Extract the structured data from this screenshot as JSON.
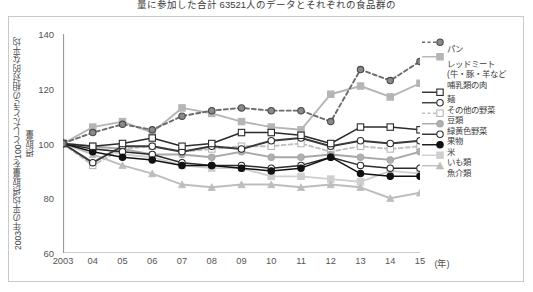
{
  "caption_top": "量に参加した合計 63521人のデータとそれぞれの食品群の",
  "axis": {
    "ylabel": "2003年の平均摂取量を100としたときの相対的な平均摂取量",
    "yticks": [
      140,
      120,
      100,
      80,
      60
    ],
    "ylim": [
      60,
      140
    ],
    "xunit": "(年)",
    "xticks": [
      "2003",
      "04",
      "05",
      "06",
      "07",
      "08",
      "09",
      "10",
      "11",
      "12",
      "13",
      "14",
      "15"
    ]
  },
  "legend": {
    "items": [
      {
        "label": "パン",
        "marker": "circle-gray-filled",
        "line": "dashed",
        "color": "#6b6b6b"
      },
      {
        "label": "レッドミート",
        "marker": "square-gray",
        "line": "solid",
        "color": "#b5b5b5"
      },
      {
        "label": "(牛・豚・羊など",
        "marker": "none",
        "line": "none",
        "color": "#b5b5b5"
      },
      {
        "label": "哺乳類の肉",
        "marker": "none",
        "line": "none",
        "color": "#b5b5b5"
      },
      {
        "label": "麺",
        "marker": "square-open",
        "line": "solid",
        "color": "#2b2b2b"
      },
      {
        "label": "その他の野菜",
        "marker": "circle-open",
        "line": "solid",
        "color": "#3a3a3a"
      },
      {
        "label": "豆類",
        "marker": "square-open-gray",
        "line": "dashed",
        "color": "#c0c0c0"
      },
      {
        "label": "緑黄色野菜",
        "marker": "circle-gray",
        "line": "solid",
        "color": "#a8a8a8"
      },
      {
        "label": "果物",
        "marker": "circle-open-dark",
        "line": "solid",
        "color": "#2b2b2b"
      },
      {
        "label": "米",
        "marker": "circle-black",
        "line": "solid",
        "color": "#111111"
      },
      {
        "label": "いも類",
        "marker": "square-lgray",
        "line": "solid",
        "color": "#cfcfcf"
      },
      {
        "label": "魚介類",
        "marker": "triangle-gray",
        "line": "solid",
        "color": "#bdbdbd"
      }
    ]
  },
  "chart_data": {
    "type": "line",
    "title": "",
    "xlabel": "(年)",
    "ylabel": "2003年の平均摂取量を100としたときの相対的な平均摂取量",
    "ylim": [
      60,
      140
    ],
    "grid": false,
    "legend_position": "right",
    "x": [
      2003,
      2004,
      2005,
      2006,
      2007,
      2008,
      2009,
      2010,
      2011,
      2012,
      2013,
      2014,
      2015
    ],
    "categories": [
      "2003",
      "04",
      "05",
      "06",
      "07",
      "08",
      "09",
      "10",
      "11",
      "12",
      "13",
      "14",
      "15"
    ],
    "series": [
      {
        "name": "パン",
        "color": "#6b6b6b",
        "line": "dashed",
        "marker": "circle-gray-filled",
        "values": [
          100,
          104,
          107,
          105,
          110,
          112,
          113,
          112,
          112,
          108,
          127,
          123,
          130
        ]
      },
      {
        "name": "レッドミート",
        "color": "#b5b5b5",
        "line": "solid",
        "marker": "square-gray",
        "values": [
          100,
          106,
          108,
          104,
          113,
          111,
          108,
          106,
          105,
          118,
          121,
          117,
          122
        ]
      },
      {
        "name": "麺",
        "color": "#2b2b2b",
        "line": "solid",
        "marker": "square-open",
        "values": [
          100,
          99,
          100,
          102,
          99,
          100,
          104,
          104,
          103,
          100,
          106,
          106,
          105
        ]
      },
      {
        "name": "その他の野菜",
        "color": "#3a3a3a",
        "line": "solid",
        "marker": "circle-open",
        "values": [
          100,
          93,
          99,
          99,
          97,
          99,
          98,
          101,
          102,
          99,
          101,
          100,
          101
        ]
      },
      {
        "name": "豆類",
        "color": "#c0c0c0",
        "line": "dashed",
        "marker": "square-open-gray",
        "values": [
          100,
          92,
          98,
          99,
          97,
          98,
          99,
          99,
          100,
          97,
          99,
          98,
          99
        ]
      },
      {
        "name": "緑黄色野菜",
        "color": "#a8a8a8",
        "line": "solid",
        "marker": "circle-gray",
        "values": [
          100,
          99,
          98,
          96,
          96,
          95,
          97,
          95,
          95,
          96,
          95,
          94,
          97
        ]
      },
      {
        "name": "果物",
        "color": "#2b2b2b",
        "line": "solid",
        "marker": "circle-open-dark",
        "values": [
          100,
          98,
          97,
          96,
          93,
          92,
          92,
          91,
          92,
          95,
          92,
          91,
          91
        ]
      },
      {
        "name": "米",
        "color": "#111111",
        "line": "solid",
        "marker": "circle-black",
        "values": [
          100,
          97,
          95,
          94,
          92,
          92,
          91,
          90,
          91,
          95,
          89,
          88,
          88
        ]
      },
      {
        "name": "いも類",
        "color": "#cfcfcf",
        "line": "solid",
        "marker": "square-lgray",
        "values": [
          100,
          99,
          96,
          95,
          92,
          91,
          91,
          88,
          88,
          87,
          86,
          90,
          89
        ]
      },
      {
        "name": "魚介類",
        "color": "#bdbdbd",
        "line": "solid",
        "marker": "triangle-gray",
        "values": [
          100,
          96,
          92,
          89,
          85,
          84,
          85,
          85,
          84,
          85,
          84,
          80,
          82
        ]
      }
    ]
  }
}
